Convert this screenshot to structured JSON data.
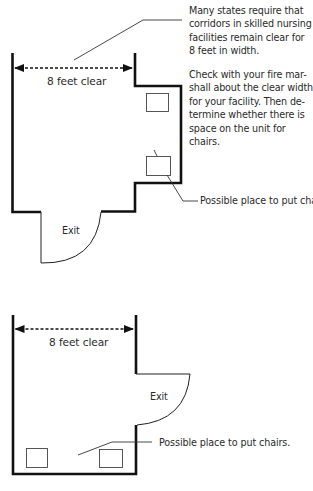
{
  "notes": {
    "paragraph_1": "Many states require that corridors in skilled nursing facilities remain clear for 8 feet in width.",
    "paragraph_1_lines": [
      "Many states require that",
      "corridors in skilled nursing",
      "facilities remain clear for",
      "8 feet in width."
    ],
    "paragraph_2": "Check with your fire marshall about the clear width for your facility. Then determine whether there is space on the unit for chairs.",
    "paragraph_2_lines": [
      "Check with your fire mar-",
      "shall about the clear width",
      "for your facility. Then de-",
      "termine whether there is",
      "space on the unit for",
      "chairs."
    ]
  },
  "diagram_1": {
    "width_label": "8 feet clear",
    "exit_label": "Exit",
    "chairs_label": "Possible place to put chairs."
  },
  "diagram_2": {
    "width_label": "8 feet clear",
    "exit_label": "Exit",
    "chairs_label": "Possible place to put chairs."
  },
  "colors": {
    "wall": "#111111",
    "thin_line": "#333333",
    "text": "#2a2a2a"
  }
}
